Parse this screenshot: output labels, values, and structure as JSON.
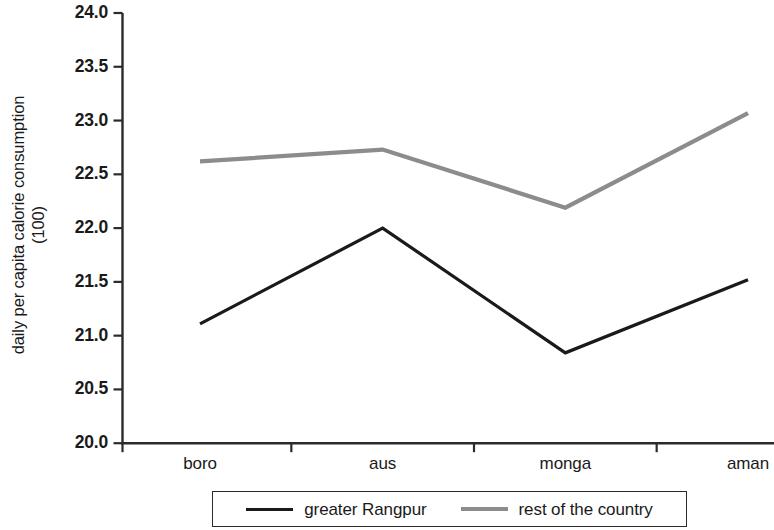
{
  "chart_data": {
    "type": "line",
    "title": "",
    "subtitle": "",
    "xlabel": "",
    "ylabel": "daily per capita calorie consumption (100)",
    "ylabel_line1": "daily per capita calorie consumption",
    "ylabel_line2": "(100)",
    "categories": [
      "boro",
      "aus",
      "monga",
      "aman"
    ],
    "ylim": [
      20.0,
      24.0
    ],
    "ytick_labels": [
      "24.0",
      "23.5",
      "23.0",
      "22.5",
      "22.0",
      "21.5",
      "21.0",
      "20.5",
      "20.0"
    ],
    "ytick_values": [
      24.0,
      23.5,
      23.0,
      22.5,
      22.0,
      21.5,
      21.0,
      20.5,
      20.0
    ],
    "grid": false,
    "legend_position": "bottom",
    "series": [
      {
        "name": "greater Rangpur",
        "color": "#1a1a1a",
        "values": [
          21.11,
          22.0,
          20.84,
          21.52
        ]
      },
      {
        "name": "rest of the country",
        "color": "#8c8c8c",
        "values": [
          22.62,
          22.73,
          22.19,
          23.07
        ]
      }
    ]
  },
  "legend": {
    "items": [
      {
        "label": "greater Rangpur",
        "swatch": "black-line-swatch"
      },
      {
        "label": "rest of the country",
        "swatch": "gray-line-swatch"
      }
    ]
  },
  "axes": {
    "y_title_line1": "daily per capita calorie consumption",
    "y_title_line2": "(100)"
  },
  "colors": {
    "series_primary": "#1a1a1a",
    "series_secondary": "#8c8c8c",
    "axis": "#2b2b2b",
    "background": "#ffffff"
  }
}
